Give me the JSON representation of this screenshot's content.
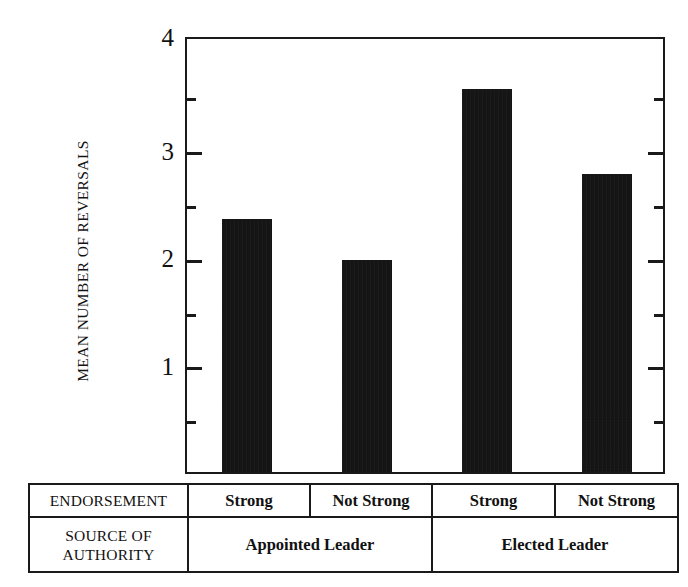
{
  "chart_data": {
    "type": "bar",
    "title": "",
    "xlabel": "",
    "ylabel": "MEAN NUMBER OF REVERSALS",
    "ylim": [
      0,
      4
    ],
    "ymajor_ticks": [
      1,
      2,
      3,
      4
    ],
    "yminor_ticks": [
      0.5,
      1.5,
      2.5,
      3.5
    ],
    "ytick_labels": [
      "1",
      "2",
      "3",
      "4"
    ],
    "grid": false,
    "legend": "none",
    "categories": [
      "Strong",
      "Not Strong",
      "Strong",
      "Not Strong"
    ],
    "groups": [
      "Appointed Leader",
      "Elected Leader"
    ],
    "values": [
      2.32,
      1.94,
      3.51,
      2.73
    ],
    "bars": [
      {
        "label": "Strong",
        "group": "Appointed Leader",
        "value": 2.32
      },
      {
        "label": "Not Strong",
        "group": "Appointed Leader",
        "value": 1.94
      },
      {
        "label": "Strong",
        "group": "Elected Leader",
        "value": 3.51
      },
      {
        "label": "Not Strong",
        "group": "Elected Leader",
        "value": 2.73
      }
    ],
    "bar_color": "#0d0d0d",
    "axis_color": "#1a1a1a"
  },
  "axis": {
    "y_title": "MEAN NUMBER OF REVERSALS",
    "ticks": [
      {
        "value": 4,
        "label": "4"
      },
      {
        "value": 3,
        "label": "3"
      },
      {
        "value": 2,
        "label": "2"
      },
      {
        "value": 1,
        "label": "1"
      }
    ]
  },
  "table": {
    "rows": [
      {
        "header": "ENDORSEMENT",
        "cells": [
          "Strong",
          "Not Strong",
          "Strong",
          "Not Strong"
        ]
      },
      {
        "header_line1": "SOURCE OF",
        "header_line2": "AUTHORITY",
        "cells": [
          "Appointed Leader",
          "Elected Leader"
        ]
      }
    ]
  }
}
